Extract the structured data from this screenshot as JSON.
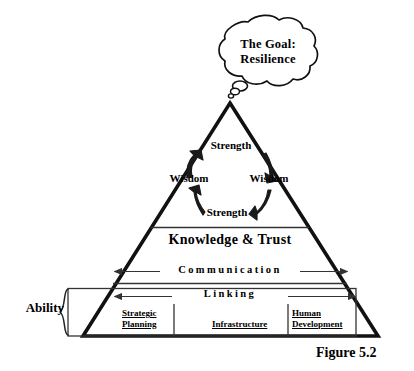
{
  "figure": {
    "caption": "Figure 5.2",
    "goal_bubble": "The Goal:\nResilience",
    "goal_line1": "The Goal:",
    "goal_line2": "Resilience"
  },
  "pyramid": {
    "cycle": {
      "strength_top": "Strength",
      "wisdom_left": "Wisdom",
      "wisdom_right": "Wisdom",
      "strength_bottom": "Strength"
    },
    "bands": [
      {
        "id": "knowledge-trust",
        "label": "Knowledge & Trust"
      },
      {
        "id": "communication",
        "label": "Communication"
      },
      {
        "id": "linking",
        "label": "Linking"
      }
    ],
    "base_cells": [
      {
        "line1": "Strategic",
        "line2": "Planning"
      },
      {
        "line1": "Infrastructure",
        "line2": ""
      },
      {
        "line1": "Human",
        "line2": "Development"
      }
    ]
  },
  "annotations": {
    "ability_label": "Ability"
  },
  "colors": {
    "ink": "#1a1a1a",
    "outline": "#111111",
    "background": "#ffffff",
    "thin_rule": "#333333"
  }
}
